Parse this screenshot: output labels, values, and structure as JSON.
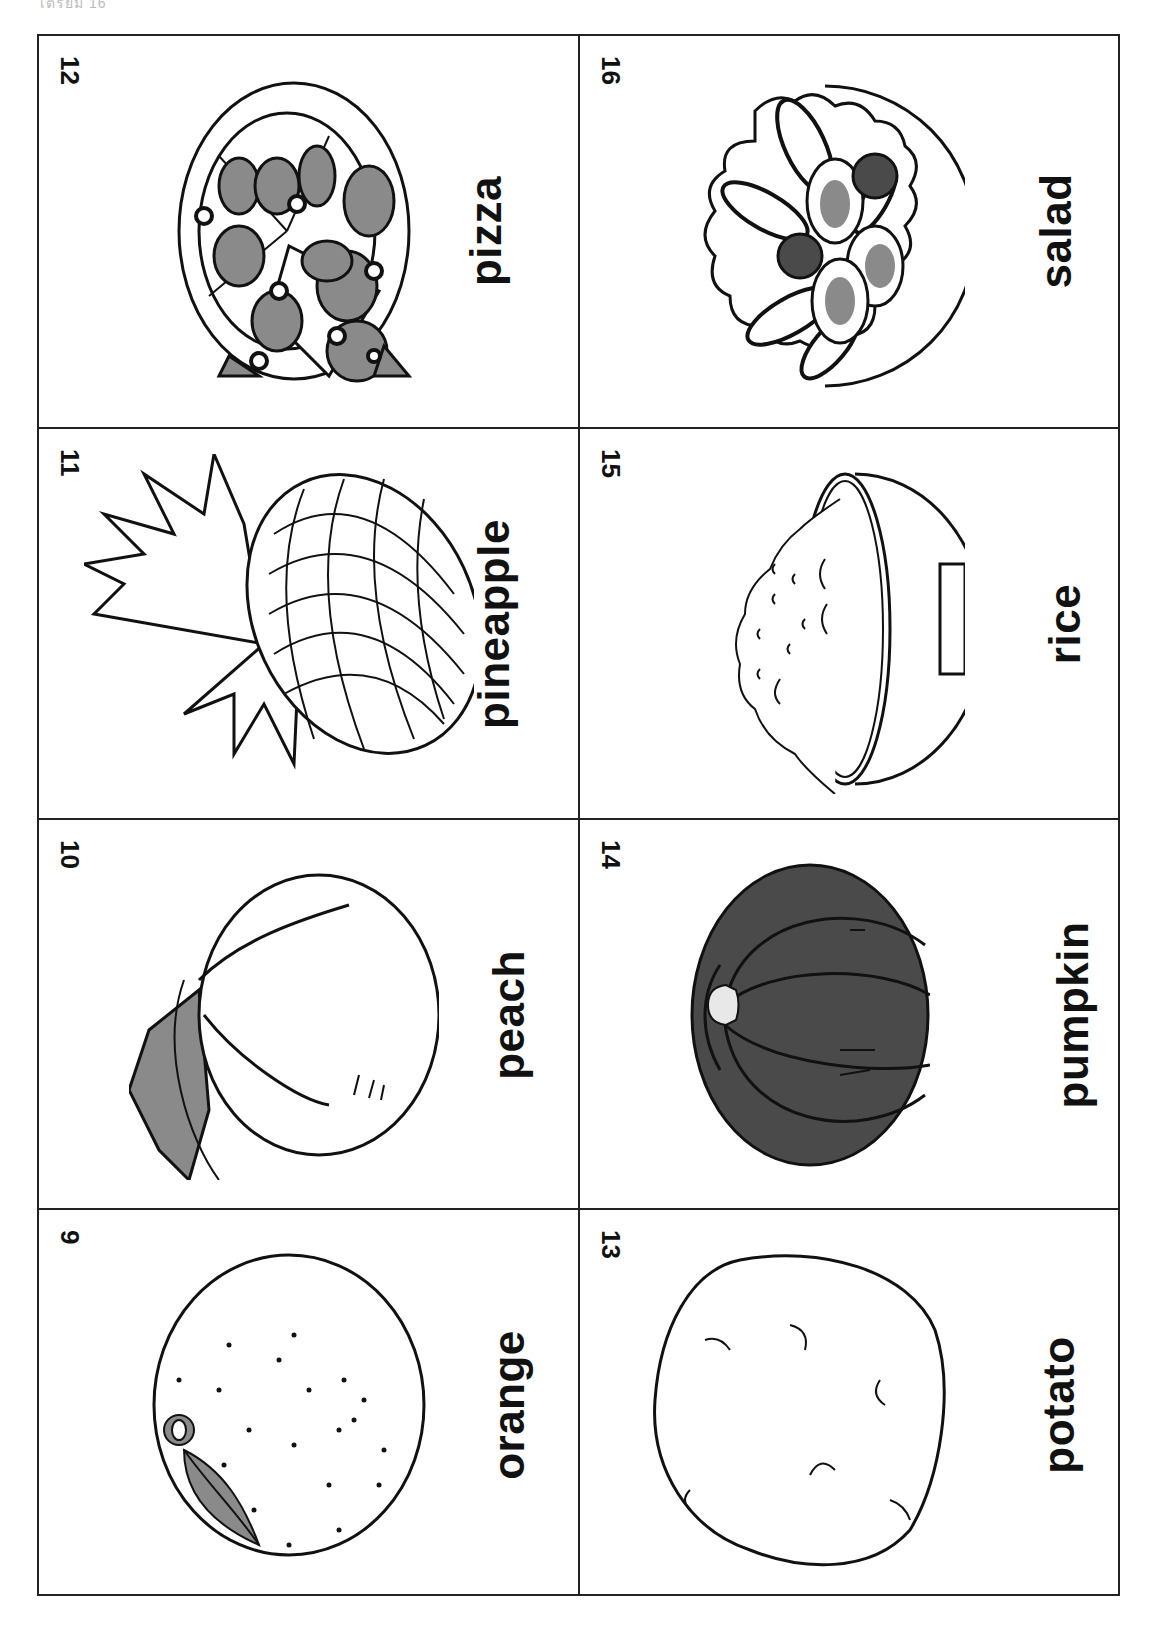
{
  "page": {
    "header_fragment": "เตรียม  16",
    "orientation_note": "flashcard sheet printed rotated 90°"
  },
  "cards": [
    {
      "number": "12",
      "word": "pizza",
      "icon": "pizza-icon"
    },
    {
      "number": "16",
      "word": "salad",
      "icon": "salad-icon"
    },
    {
      "number": "11",
      "word": "pineapple",
      "icon": "pineapple-icon"
    },
    {
      "number": "15",
      "word": "rice",
      "icon": "rice-bowl-icon"
    },
    {
      "number": "10",
      "word": "peach",
      "icon": "peach-icon"
    },
    {
      "number": "14",
      "word": "pumpkin",
      "icon": "pumpkin-icon"
    },
    {
      "number": "9",
      "word": "orange",
      "icon": "orange-icon"
    },
    {
      "number": "13",
      "word": "potato",
      "icon": "potato-icon"
    }
  ],
  "colors": {
    "line": "#222222",
    "fill_dark": "#4a4a4a",
    "fill_mid": "#8a8a8a",
    "paper": "#ffffff"
  }
}
